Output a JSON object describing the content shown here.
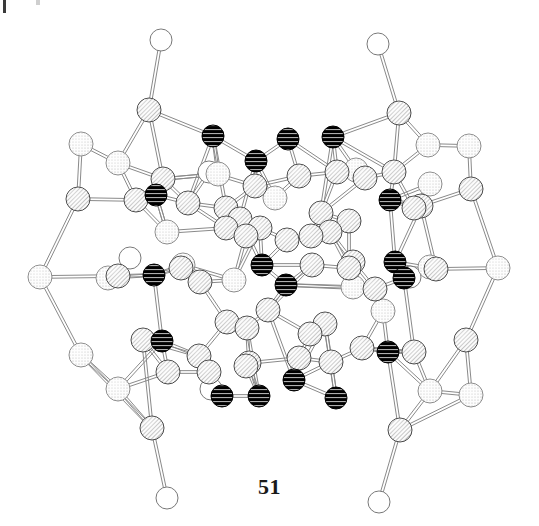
{
  "figure": {
    "caption": "51",
    "background_color": "#ffffff"
  },
  "legend": {
    "atom_styles": {
      "hatched": {
        "name": "hatched-atom",
        "fill_color": "#f2f2f2",
        "stroke_color": "#4a4a4a",
        "pattern": "diagonal-hatch",
        "radius": 12
      },
      "stippled": {
        "name": "stippled-atom",
        "fill_color": "#f7f7f7",
        "stroke_color": "#8c8c8c",
        "pattern": "stipple-dots",
        "radius": 12
      },
      "black": {
        "name": "black-atom",
        "fill_color": "#000000",
        "stroke_color": "#000000",
        "pattern": "horizontal-stripes",
        "radius": 11
      },
      "open": {
        "name": "open-atom",
        "fill_color": "#ffffff",
        "stroke_color": "#777777",
        "pattern": "none",
        "radius": 11
      }
    },
    "bond_color": "#8a8a8a",
    "bond_width": 1
  },
  "chart_data": {
    "type": "scatter",
    "title": "51",
    "xlabel": "",
    "ylabel": "",
    "xlim": [
      0,
      539
    ],
    "ylim": [
      0,
      526
    ],
    "grid": false,
    "legend": "none",
    "atom_count": 96,
    "bond_count": 150,
    "series": [
      {
        "name": "hatched",
        "count": 45
      },
      {
        "name": "stippled",
        "count": 26
      },
      {
        "name": "black",
        "count": 17
      },
      {
        "name": "open",
        "count": 8
      }
    ],
    "atoms": [
      {
        "id": 0,
        "x": 161,
        "y": 40,
        "t": "open"
      },
      {
        "id": 1,
        "x": 378,
        "y": 44,
        "t": "open"
      },
      {
        "id": 2,
        "x": 209,
        "y": 172,
        "t": "open"
      },
      {
        "id": 3,
        "x": 130,
        "y": 258,
        "t": "open"
      },
      {
        "id": 4,
        "x": 410,
        "y": 277,
        "t": "open"
      },
      {
        "id": 5,
        "x": 211,
        "y": 389,
        "t": "open"
      },
      {
        "id": 6,
        "x": 167,
        "y": 498,
        "t": "open"
      },
      {
        "id": 7,
        "x": 379,
        "y": 502,
        "t": "open"
      },
      {
        "id": 8,
        "x": 149,
        "y": 110,
        "t": "hatched"
      },
      {
        "id": 9,
        "x": 399,
        "y": 113,
        "t": "hatched"
      },
      {
        "id": 10,
        "x": 81,
        "y": 144,
        "t": "stippled"
      },
      {
        "id": 11,
        "x": 118,
        "y": 163,
        "t": "stippled"
      },
      {
        "id": 12,
        "x": 428,
        "y": 145,
        "t": "stippled"
      },
      {
        "id": 13,
        "x": 469,
        "y": 146,
        "t": "stippled"
      },
      {
        "id": 14,
        "x": 78,
        "y": 199,
        "t": "hatched"
      },
      {
        "id": 15,
        "x": 471,
        "y": 189,
        "t": "hatched"
      },
      {
        "id": 16,
        "x": 40,
        "y": 277,
        "t": "stippled"
      },
      {
        "id": 17,
        "x": 498,
        "y": 268,
        "t": "stippled"
      },
      {
        "id": 18,
        "x": 81,
        "y": 355,
        "t": "stippled"
      },
      {
        "id": 19,
        "x": 118,
        "y": 389,
        "t": "stippled"
      },
      {
        "id": 20,
        "x": 466,
        "y": 340,
        "t": "hatched"
      },
      {
        "id": 21,
        "x": 430,
        "y": 391,
        "t": "stippled"
      },
      {
        "id": 22,
        "x": 471,
        "y": 395,
        "t": "stippled"
      },
      {
        "id": 23,
        "x": 152,
        "y": 428,
        "t": "hatched"
      },
      {
        "id": 24,
        "x": 400,
        "y": 430,
        "t": "hatched"
      },
      {
        "id": 25,
        "x": 213,
        "y": 136,
        "t": "black"
      },
      {
        "id": 26,
        "x": 288,
        "y": 139,
        "t": "black"
      },
      {
        "id": 27,
        "x": 333,
        "y": 137,
        "t": "black"
      },
      {
        "id": 28,
        "x": 256,
        "y": 161,
        "t": "black"
      },
      {
        "id": 29,
        "x": 390,
        "y": 200,
        "t": "black"
      },
      {
        "id": 30,
        "x": 156,
        "y": 195,
        "t": "black"
      },
      {
        "id": 31,
        "x": 154,
        "y": 275,
        "t": "black"
      },
      {
        "id": 32,
        "x": 262,
        "y": 265,
        "t": "black"
      },
      {
        "id": 33,
        "x": 286,
        "y": 285,
        "t": "black"
      },
      {
        "id": 34,
        "x": 395,
        "y": 262,
        "t": "black"
      },
      {
        "id": 35,
        "x": 404,
        "y": 278,
        "t": "black"
      },
      {
        "id": 36,
        "x": 162,
        "y": 341,
        "t": "black"
      },
      {
        "id": 37,
        "x": 388,
        "y": 352,
        "t": "black"
      },
      {
        "id": 38,
        "x": 294,
        "y": 380,
        "t": "black"
      },
      {
        "id": 39,
        "x": 259,
        "y": 396,
        "t": "black"
      },
      {
        "id": 40,
        "x": 336,
        "y": 398,
        "t": "black"
      },
      {
        "id": 41,
        "x": 222,
        "y": 396,
        "t": "black"
      },
      {
        "id": 42,
        "x": 163,
        "y": 179,
        "t": "hatched"
      },
      {
        "id": 43,
        "x": 136,
        "y": 200,
        "t": "hatched"
      },
      {
        "id": 44,
        "x": 188,
        "y": 203,
        "t": "hatched"
      },
      {
        "id": 45,
        "x": 255,
        "y": 186,
        "t": "hatched"
      },
      {
        "id": 46,
        "x": 299,
        "y": 176,
        "t": "hatched"
      },
      {
        "id": 47,
        "x": 337,
        "y": 172,
        "t": "hatched"
      },
      {
        "id": 48,
        "x": 365,
        "y": 178,
        "t": "hatched"
      },
      {
        "id": 49,
        "x": 394,
        "y": 172,
        "t": "hatched"
      },
      {
        "id": 50,
        "x": 226,
        "y": 208,
        "t": "hatched"
      },
      {
        "id": 51,
        "x": 240,
        "y": 219,
        "t": "hatched"
      },
      {
        "id": 52,
        "x": 321,
        "y": 213,
        "t": "hatched"
      },
      {
        "id": 53,
        "x": 349,
        "y": 221,
        "t": "hatched"
      },
      {
        "id": 54,
        "x": 414,
        "y": 208,
        "t": "hatched"
      },
      {
        "id": 55,
        "x": 226,
        "y": 228,
        "t": "hatched"
      },
      {
        "id": 56,
        "x": 246,
        "y": 236,
        "t": "hatched"
      },
      {
        "id": 57,
        "x": 311,
        "y": 236,
        "t": "hatched"
      },
      {
        "id": 58,
        "x": 330,
        "y": 232,
        "t": "hatched"
      },
      {
        "id": 59,
        "x": 421,
        "y": 206,
        "t": "hatched"
      },
      {
        "id": 60,
        "x": 181,
        "y": 268,
        "t": "hatched"
      },
      {
        "id": 61,
        "x": 200,
        "y": 282,
        "t": "hatched"
      },
      {
        "id": 62,
        "x": 118,
        "y": 276,
        "t": "hatched"
      },
      {
        "id": 63,
        "x": 312,
        "y": 265,
        "t": "hatched"
      },
      {
        "id": 64,
        "x": 349,
        "y": 268,
        "t": "hatched"
      },
      {
        "id": 65,
        "x": 353,
        "y": 262,
        "t": "hatched"
      },
      {
        "id": 66,
        "x": 436,
        "y": 269,
        "t": "hatched"
      },
      {
        "id": 67,
        "x": 375,
        "y": 289,
        "t": "hatched"
      },
      {
        "id": 68,
        "x": 227,
        "y": 322,
        "t": "hatched"
      },
      {
        "id": 69,
        "x": 247,
        "y": 328,
        "t": "hatched"
      },
      {
        "id": 70,
        "x": 143,
        "y": 340,
        "t": "hatched"
      },
      {
        "id": 71,
        "x": 325,
        "y": 324,
        "t": "hatched"
      },
      {
        "id": 72,
        "x": 310,
        "y": 334,
        "t": "hatched"
      },
      {
        "id": 73,
        "x": 199,
        "y": 356,
        "t": "hatched"
      },
      {
        "id": 74,
        "x": 249,
        "y": 363,
        "t": "hatched"
      },
      {
        "id": 75,
        "x": 168,
        "y": 372,
        "t": "hatched"
      },
      {
        "id": 76,
        "x": 209,
        "y": 372,
        "t": "hatched"
      },
      {
        "id": 77,
        "x": 246,
        "y": 366,
        "t": "hatched"
      },
      {
        "id": 78,
        "x": 299,
        "y": 358,
        "t": "hatched"
      },
      {
        "id": 79,
        "x": 331,
        "y": 362,
        "t": "hatched"
      },
      {
        "id": 80,
        "x": 362,
        "y": 348,
        "t": "hatched"
      },
      {
        "id": 81,
        "x": 414,
        "y": 352,
        "t": "hatched"
      },
      {
        "id": 82,
        "x": 260,
        "y": 228,
        "t": "hatched"
      },
      {
        "id": 83,
        "x": 287,
        "y": 240,
        "t": "hatched"
      },
      {
        "id": 84,
        "x": 167,
        "y": 232,
        "t": "stippled"
      },
      {
        "id": 85,
        "x": 268,
        "y": 310,
        "t": "hatched"
      },
      {
        "id": 86,
        "x": 234,
        "y": 280,
        "t": "stippled"
      },
      {
        "id": 87,
        "x": 183,
        "y": 265,
        "t": "stippled"
      },
      {
        "id": 88,
        "x": 353,
        "y": 287,
        "t": "stippled"
      },
      {
        "id": 89,
        "x": 430,
        "y": 267,
        "t": "stippled"
      },
      {
        "id": 90,
        "x": 108,
        "y": 278,
        "t": "stippled"
      },
      {
        "id": 91,
        "x": 218,
        "y": 174,
        "t": "stippled"
      },
      {
        "id": 92,
        "x": 356,
        "y": 170,
        "t": "stippled"
      },
      {
        "id": 93,
        "x": 275,
        "y": 198,
        "t": "stippled"
      },
      {
        "id": 94,
        "x": 430,
        "y": 184,
        "t": "stippled"
      },
      {
        "id": 95,
        "x": 383,
        "y": 311,
        "t": "stippled"
      }
    ],
    "bonds": [
      [
        0,
        8
      ],
      [
        1,
        9
      ],
      [
        8,
        11
      ],
      [
        8,
        25
      ],
      [
        8,
        42
      ],
      [
        9,
        12
      ],
      [
        9,
        27
      ],
      [
        9,
        49
      ],
      [
        10,
        11
      ],
      [
        10,
        14
      ],
      [
        11,
        42
      ],
      [
        11,
        43
      ],
      [
        12,
        13
      ],
      [
        12,
        49
      ],
      [
        13,
        15
      ],
      [
        14,
        16
      ],
      [
        14,
        43
      ],
      [
        15,
        17
      ],
      [
        15,
        54
      ],
      [
        16,
        62
      ],
      [
        16,
        18
      ],
      [
        17,
        66
      ],
      [
        17,
        20
      ],
      [
        18,
        19
      ],
      [
        18,
        23
      ],
      [
        19,
        23
      ],
      [
        19,
        75
      ],
      [
        20,
        21
      ],
      [
        20,
        22
      ],
      [
        21,
        22
      ],
      [
        21,
        24
      ],
      [
        21,
        81
      ],
      [
        22,
        24
      ],
      [
        23,
        6
      ],
      [
        23,
        70
      ],
      [
        24,
        7
      ],
      [
        24,
        37
      ],
      [
        25,
        28
      ],
      [
        25,
        44
      ],
      [
        25,
        50
      ],
      [
        26,
        28
      ],
      [
        26,
        46
      ],
      [
        26,
        47
      ],
      [
        27,
        47
      ],
      [
        27,
        49
      ],
      [
        27,
        52
      ],
      [
        28,
        45
      ],
      [
        28,
        93
      ],
      [
        28,
        51
      ],
      [
        29,
        49
      ],
      [
        29,
        54
      ],
      [
        29,
        59
      ],
      [
        29,
        34
      ],
      [
        30,
        42
      ],
      [
        30,
        43
      ],
      [
        30,
        44
      ],
      [
        30,
        84
      ],
      [
        31,
        60
      ],
      [
        31,
        62
      ],
      [
        31,
        87
      ],
      [
        31,
        36
      ],
      [
        32,
        33
      ],
      [
        32,
        63
      ],
      [
        32,
        82
      ],
      [
        32,
        83
      ],
      [
        33,
        63
      ],
      [
        33,
        67
      ],
      [
        33,
        85
      ],
      [
        34,
        35
      ],
      [
        34,
        66
      ],
      [
        34,
        59
      ],
      [
        35,
        66
      ],
      [
        35,
        67
      ],
      [
        35,
        81
      ],
      [
        36,
        70
      ],
      [
        36,
        73
      ],
      [
        36,
        75
      ],
      [
        37,
        80
      ],
      [
        37,
        81
      ],
      [
        37,
        95
      ],
      [
        38,
        40
      ],
      [
        38,
        79
      ],
      [
        38,
        85
      ],
      [
        39,
        41
      ],
      [
        39,
        74
      ],
      [
        39,
        77
      ],
      [
        40,
        79
      ],
      [
        40,
        71
      ],
      [
        41,
        76
      ],
      [
        41,
        5
      ],
      [
        42,
        44
      ],
      [
        42,
        91
      ],
      [
        43,
        84
      ],
      [
        44,
        50
      ],
      [
        44,
        55
      ],
      [
        45,
        50
      ],
      [
        45,
        46
      ],
      [
        45,
        93
      ],
      [
        46,
        47
      ],
      [
        46,
        93
      ],
      [
        47,
        48
      ],
      [
        47,
        52
      ],
      [
        48,
        49
      ],
      [
        48,
        52
      ],
      [
        48,
        92
      ],
      [
        49,
        54
      ],
      [
        50,
        51
      ],
      [
        50,
        55
      ],
      [
        51,
        56
      ],
      [
        51,
        82
      ],
      [
        52,
        53
      ],
      [
        52,
        57
      ],
      [
        53,
        58
      ],
      [
        53,
        64
      ],
      [
        54,
        59
      ],
      [
        54,
        94
      ],
      [
        55,
        56
      ],
      [
        55,
        84
      ],
      [
        56,
        82
      ],
      [
        56,
        86
      ],
      [
        57,
        58
      ],
      [
        57,
        83
      ],
      [
        58,
        64
      ],
      [
        58,
        65
      ],
      [
        59,
        66
      ],
      [
        60,
        61
      ],
      [
        60,
        87
      ],
      [
        61,
        86
      ],
      [
        61,
        68
      ],
      [
        62,
        90
      ],
      [
        62,
        3
      ],
      [
        63,
        64
      ],
      [
        63,
        85
      ],
      [
        64,
        65
      ],
      [
        64,
        88
      ],
      [
        65,
        67
      ],
      [
        66,
        89
      ],
      [
        66,
        4
      ],
      [
        67,
        88
      ],
      [
        67,
        95
      ],
      [
        68,
        69
      ],
      [
        68,
        73
      ],
      [
        69,
        74
      ],
      [
        69,
        85
      ],
      [
        70,
        75
      ],
      [
        70,
        73
      ],
      [
        71,
        72
      ],
      [
        71,
        79
      ],
      [
        72,
        78
      ],
      [
        72,
        85
      ],
      [
        73,
        76
      ],
      [
        74,
        77
      ],
      [
        74,
        78
      ],
      [
        75,
        76
      ],
      [
        76,
        5
      ],
      [
        78,
        79
      ],
      [
        78,
        38
      ],
      [
        79,
        80
      ],
      [
        80,
        81
      ],
      [
        80,
        95
      ],
      [
        82,
        83
      ],
      [
        82,
        86
      ],
      [
        83,
        57
      ],
      [
        86,
        87
      ],
      [
        2,
        44
      ],
      [
        2,
        45
      ],
      [
        91,
        42
      ],
      [
        92,
        48
      ],
      [
        94,
        54
      ],
      [
        89,
        66
      ],
      [
        90,
        62
      ],
      [
        25,
        91
      ],
      [
        27,
        92
      ],
      [
        31,
        90
      ],
      [
        35,
        89
      ],
      [
        29,
        94
      ],
      [
        30,
        84
      ],
      [
        36,
        19
      ],
      [
        37,
        21
      ],
      [
        32,
        51
      ],
      [
        33,
        88
      ],
      [
        38,
        71
      ],
      [
        39,
        69
      ]
    ]
  }
}
